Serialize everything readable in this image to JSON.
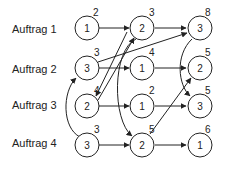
{
  "rows": [
    {
      "label": "Auftrag 1"
    },
    {
      "label": "Auftrag 2"
    },
    {
      "label": "Auftrag 3"
    },
    {
      "label": "Auftrag 4"
    }
  ],
  "nodes": {
    "r1c1": {
      "value": "1",
      "time": "2"
    },
    "r1c2": {
      "value": "2",
      "time": "3"
    },
    "r1c3": {
      "value": "3",
      "time": "8"
    },
    "r2c1": {
      "value": "3",
      "time": "3"
    },
    "r2c2": {
      "value": "1",
      "time": "4"
    },
    "r2c3": {
      "value": "2",
      "time": "5"
    },
    "r3c1": {
      "value": "2",
      "time": "4"
    },
    "r3c2": {
      "value": "1",
      "time": "2"
    },
    "r3c3": {
      "value": "3",
      "time": "5"
    },
    "r4c1": {
      "value": "3",
      "time": "3"
    },
    "r4c2": {
      "value": "2",
      "time": "5"
    },
    "r4c3": {
      "value": "1",
      "time": "6"
    }
  },
  "colors": {
    "stroke": "#222222",
    "background": "#ffffff"
  }
}
